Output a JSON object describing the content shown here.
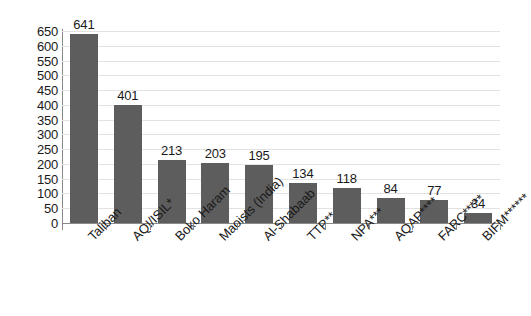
{
  "chart_data": {
    "type": "bar",
    "title": "",
    "subtitle": "",
    "xlabel": "",
    "ylabel": "",
    "categories": [
      "Taliban",
      "AQI/ISIL*",
      "Boko Haram",
      "Maoists (India)",
      "Al-Shabaab",
      "TTP**",
      "NPA***",
      "AQAP****",
      "FARC*****",
      "BIFM******"
    ],
    "values": [
      641,
      401,
      213,
      203,
      195,
      134,
      118,
      84,
      77,
      34
    ],
    "ylim": [
      0,
      650
    ],
    "ytick_step": 50,
    "yticks": [
      0,
      50,
      100,
      150,
      200,
      250,
      300,
      350,
      400,
      450,
      500,
      550,
      600,
      650
    ],
    "ytick_labels": [
      "0",
      "50",
      "100",
      "150",
      "200",
      "250",
      "300",
      "350",
      "400",
      "450",
      "500",
      "550",
      "600",
      "650"
    ],
    "grid": true,
    "legend": null,
    "legend_position": "none",
    "bar_color": "#5d5d5d",
    "gridline_color": "#e2e2e2",
    "axis_color": "#8a8a8a",
    "background_color": "#ffffff",
    "data_labels": [
      "641",
      "401",
      "213",
      "203",
      "195",
      "134",
      "118",
      "84",
      "77",
      "34"
    ]
  }
}
